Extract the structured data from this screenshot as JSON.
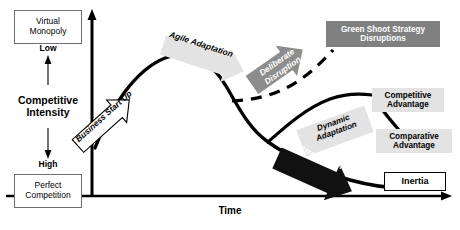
{
  "diagram": {
    "title_implicit": "Competitive Intensity over Time",
    "axes": {
      "y_title": "Competitive\nIntensity",
      "y_top_box": "Virtual\nMonopoly",
      "y_bottom_box": "Perfect\nCompetition",
      "y_top_word": "Low",
      "y_bottom_word": "High",
      "x_title": "Time"
    },
    "callouts": {
      "business_start_up": "Business Start Up",
      "agile_adaptation": "Agile Adaptation",
      "deliberate_disruption": "Deliberate\nDisruption",
      "green_shoot": "Green Shoot Strategy\nDisruptions",
      "dynamic_adaptation": "Dynamic\nAdaptation",
      "competitive_advantage": "Competitive\nAdvantage",
      "comparative_advantage": "Comparative\nAdvantage",
      "strategic_drift": "Strategic Drift",
      "inertia": "Inertia"
    },
    "colors": {
      "curve": "#000000",
      "gray_fill": "#808080",
      "light_fill": "#e3e3e3",
      "arrow_black": "#111111",
      "axis": "#000000",
      "box_border": "#6f6f6f"
    }
  }
}
